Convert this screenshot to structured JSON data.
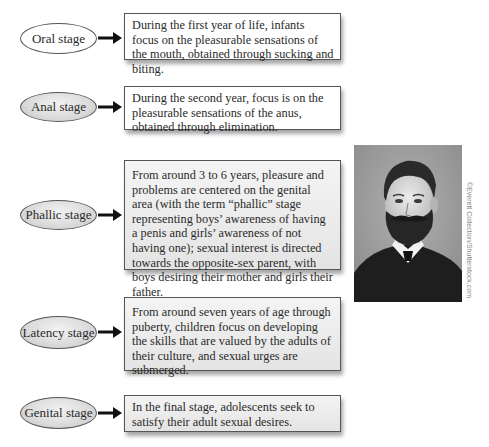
{
  "stages": [
    {
      "label": "Oral stage",
      "description": "During the first year of life, infants focus on the pleasurable sensations of the mouth, obtained through sucking and biting."
    },
    {
      "label": "Anal stage",
      "description": "During the second year, focus is on the pleasurable sensations of the anus, obtained through elimination."
    },
    {
      "label": "Phallic stage",
      "description": "From around 3 to 6 years, pleasure and problems are centered on the genital area (with the term “phallic” stage representing boys’ awareness of having a penis and girls’ awareness of not having one); sexual interest is directed towards the opposite-sex parent, with boys desiring their mother and girls their father."
    },
    {
      "label": "Latency stage",
      "description": "From around seven years of age through puberty, children focus on developing the skills that are valued by the adults of their culture, and sexual urges are submerged."
    },
    {
      "label": "Genital stage",
      "description": "In the final stage, adolescents seek to satisfy their adult sexual desires."
    }
  ],
  "photo": {
    "subject": "portrait-photo",
    "credit": "©Everett Collection/Shutterstock.com"
  },
  "colors": {
    "border": "#555555",
    "text": "#2a2a2a",
    "arrow": "#111111",
    "shaded_fill": "#e4e4e4"
  }
}
